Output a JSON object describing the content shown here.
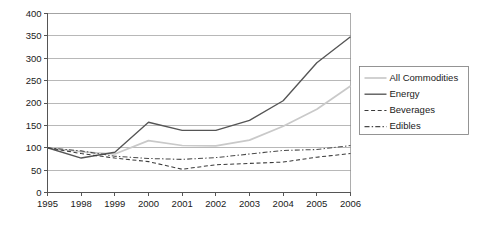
{
  "chart_data": {
    "type": "line",
    "title": "",
    "xlabel": "",
    "ylabel": "",
    "categories": [
      "1995",
      "1998",
      "1999",
      "2000",
      "2001",
      "2002",
      "2003",
      "2004",
      "2005",
      "2006"
    ],
    "ylim": [
      0,
      400
    ],
    "yticks": [
      0,
      50,
      100,
      150,
      200,
      250,
      300,
      350,
      400
    ],
    "grid": true,
    "legend_position": "right",
    "series": [
      {
        "name": "All Commodities",
        "color": "#c9c9c9",
        "style": "solid",
        "values": [
          100,
          91,
          86,
          116,
          105,
          104,
          117,
          148,
          186,
          238
        ]
      },
      {
        "name": "Energy",
        "color": "#555555",
        "style": "solid",
        "values": [
          100,
          77,
          90,
          157,
          139,
          139,
          161,
          205,
          290,
          348
        ]
      },
      {
        "name": "Beverages",
        "color": "#3a3a3a",
        "style": "dashed",
        "values": [
          100,
          87,
          77,
          69,
          52,
          62,
          65,
          68,
          79,
          87
        ]
      },
      {
        "name": "Edibles",
        "color": "#4a4a4a",
        "style": "dashdot",
        "values": [
          100,
          93,
          81,
          76,
          74,
          78,
          86,
          94,
          96,
          105
        ]
      }
    ]
  },
  "legend": {
    "entries": [
      {
        "label": "All Commodities"
      },
      {
        "label": "Energy"
      },
      {
        "label": "Beverages"
      },
      {
        "label": "Edibles"
      }
    ]
  },
  "axes": {
    "ytick_labels": [
      "400",
      "350",
      "300",
      "250",
      "200",
      "150",
      "100",
      "50",
      "0"
    ],
    "xtick_labels": [
      "1995",
      "1998",
      "1999",
      "2000",
      "2001",
      "2002",
      "2003",
      "2004",
      "2005",
      "2006"
    ]
  }
}
